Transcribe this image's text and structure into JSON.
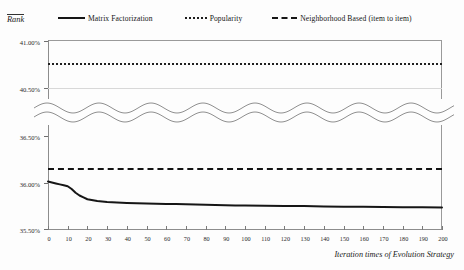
{
  "chart_data": {
    "type": "line",
    "title": "",
    "xlabel": "Iteration times of Evolution Strategy",
    "ylabel": "Rank",
    "xlim": [
      0,
      200
    ],
    "xticks": [
      0,
      10,
      20,
      30,
      40,
      50,
      60,
      70,
      80,
      90,
      100,
      110,
      120,
      130,
      140,
      150,
      160,
      170,
      180,
      190,
      200
    ],
    "xtick_labels": [
      "0",
      "10",
      "20",
      "30",
      "40",
      "50",
      "60",
      "70",
      "80",
      "90",
      "100",
      "110",
      "120",
      "130",
      "140",
      "150",
      "160",
      "170",
      "180",
      "190",
      "200"
    ],
    "ytick_labels": [
      "41.00%",
      "40.50%",
      "36.50%",
      "36.00%",
      "35.50%"
    ],
    "yticks": [
      41.0,
      40.5,
      36.5,
      36.0,
      35.5
    ],
    "y_axis_broken": true,
    "y_segment_upper": [
      40.5,
      41.0
    ],
    "y_segment_lower": [
      35.5,
      36.5
    ],
    "grid": "horizontal-light",
    "legend_position": "top",
    "series": [
      {
        "name": "Matrix Factorization",
        "style": "solid",
        "color": "#161616",
        "x": [
          0,
          2,
          4,
          6,
          8,
          10,
          12,
          14,
          16,
          18,
          20,
          25,
          30,
          35,
          40,
          45,
          50,
          55,
          60,
          65,
          70,
          75,
          80,
          85,
          90,
          95,
          100,
          110,
          120,
          130,
          140,
          150,
          160,
          170,
          180,
          190,
          200
        ],
        "values": [
          36.01,
          36.0,
          35.99,
          35.98,
          35.97,
          35.96,
          35.93,
          35.89,
          35.86,
          35.84,
          35.82,
          35.8,
          35.79,
          35.785,
          35.78,
          35.777,
          35.775,
          35.772,
          35.77,
          35.768,
          35.766,
          35.764,
          35.762,
          35.758,
          35.756,
          35.754,
          35.752,
          35.75,
          35.748,
          35.746,
          35.742,
          35.74,
          35.738,
          35.736,
          35.734,
          35.733,
          35.732
        ]
      },
      {
        "name": "Popularity",
        "style": "dotted",
        "color": "#1f1f1f",
        "constant": 40.77
      },
      {
        "name": "Neighborhood Based (item to item)",
        "style": "dashed",
        "color": "#141414",
        "constant": 36.16
      }
    ]
  },
  "legend": {
    "items": [
      {
        "label": "Matrix Factorization",
        "style": "solid"
      },
      {
        "label": "Popularity",
        "style": "dotted"
      },
      {
        "label": "Neighborhood Based (item to item)",
        "style": "dashed"
      }
    ]
  },
  "axes": {
    "y_title": "Rank",
    "x_title": "Iteration times of Evolution Strategy"
  }
}
